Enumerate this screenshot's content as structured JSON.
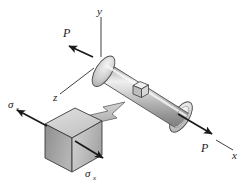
{
  "figure": {
    "background_color": "#ffffff",
    "line_color": "#1a1a1a",
    "labels": {
      "axis_y": "y",
      "axis_x": "x",
      "axis_z": "z",
      "force_top_left": "P",
      "force_bottom_right": "P",
      "sigma_upper_left": "σ",
      "sigma_upper_left_sub": "x",
      "sigma_lower_right": "σ",
      "sigma_lower_right_sub": "x"
    },
    "elements": {
      "bar_name": "circular cylindrical bar",
      "bar_fill_light": "#e8e8e8",
      "bar_fill_mid": "#b9b9b9",
      "bar_fill_dark": "#8a8a8a",
      "endcap_fill_light": "#f2f2f2",
      "endcap_fill_dark": "#a8a8a8",
      "stress_cube_top_fill": "#d6d6d6",
      "stress_cube_left_fill": "#9e9e9e",
      "stress_cube_front_fill": "#bdbdbd",
      "callout_arrow_fill": "#c4c4c4",
      "callout_arrow_stroke": "#6e6e6e"
    }
  }
}
